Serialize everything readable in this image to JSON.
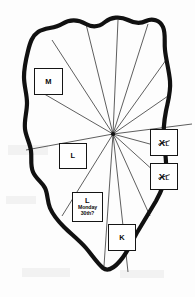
{
  "figure": {
    "type": "hand-drawn-map-diagram",
    "background_color": "#fdfdfd",
    "outline_color": "#111111",
    "sector_line_color": "#2a2a2a",
    "box_border_color": "#151515",
    "box_fill_color": "#ffffff",
    "text_color": "#0b0b0b"
  },
  "hub": {
    "label": "central-convergence-point",
    "x": 113,
    "y": 134,
    "radiating_line_count": 13
  },
  "boxes": [
    {
      "id": "box-m",
      "name": "M",
      "main": "M",
      "sub": "",
      "style": "plain",
      "x": 34,
      "y": 68,
      "width": 29,
      "height": 27
    },
    {
      "id": "box-l-left",
      "name": "L",
      "main": "L",
      "sub": "",
      "style": "plain",
      "x": 59,
      "y": 143,
      "width": 28,
      "height": 26
    },
    {
      "id": "box-xl-upper",
      "name": "XL",
      "main": "XL",
      "sub": "",
      "style": "crossed",
      "x": 150,
      "y": 129,
      "width": 28,
      "height": 27
    },
    {
      "id": "box-xl-lower",
      "name": "XL",
      "main": "XL",
      "sub": "",
      "style": "crossed",
      "x": 150,
      "y": 163,
      "width": 28,
      "height": 27
    },
    {
      "id": "box-l-monday",
      "name": "L Monday 30th?",
      "main": "L",
      "sub": "Monday\n30th?",
      "sub_line1": "Monday",
      "sub_line2": "30th?",
      "style": "multiline",
      "x": 72,
      "y": 192,
      "width": 31,
      "height": 30
    },
    {
      "id": "box-k",
      "name": "K",
      "main": "K",
      "sub": "",
      "style": "plain",
      "x": 108,
      "y": 224,
      "width": 28,
      "height": 27
    }
  ],
  "outline": {
    "stroke_width": 4.2,
    "path": "M 62,24 C 70,19 79,20 86,24 C 93,28 99,27 105,22 C 111,17 120,16 128,20 C 134,23 140,24 146,21 C 152,18 160,20 163,27 C 166,34 164,42 165,50 C 166,60 169,70 170,81 C 171,92 168,101 166,111 C 164,121 163,131 164,142 C 165,153 167,163 166,173 C 165,183 161,192 156,201 C 150,211 144,221 138,231 C 132,241 128,252 120,261 C 114,268 108,272 103,268 C 97,263 92,255 86,248 C 79,240 71,234 64,227 C 58,221 53,215 50,208 C 47,201 48,194 45,188 C 42,182 36,179 33,172 C 30,165 32,158 31,151 C 30,143 26,137 25,129 C 24,120 27,112 27,103 C 27,94 24,86 24,77 C 24,68 26,59 28,51 C 30,43 32,36 38,32 C 45,27 54,29 62,24 Z"
  },
  "sector_lines": [
    {
      "id": "line-1",
      "to_x": 52,
      "to_y": 40
    },
    {
      "id": "line-2",
      "to_x": 86,
      "to_y": 24
    },
    {
      "id": "line-3",
      "to_x": 118,
      "to_y": 20
    },
    {
      "id": "line-4",
      "to_x": 148,
      "to_y": 24
    },
    {
      "id": "line-5",
      "to_x": 166,
      "to_y": 60
    },
    {
      "id": "line-6",
      "to_x": 168,
      "to_y": 96
    },
    {
      "id": "line-7",
      "to_x": 192,
      "to_y": 124
    },
    {
      "id": "line-8",
      "to_x": 172,
      "to_y": 150
    },
    {
      "id": "line-9",
      "to_x": 166,
      "to_y": 182
    },
    {
      "id": "line-10",
      "to_x": 150,
      "to_y": 216
    },
    {
      "id": "line-11",
      "to_x": 128,
      "to_y": 272
    },
    {
      "id": "line-12",
      "to_x": 104,
      "to_y": 266
    },
    {
      "id": "line-13",
      "to_x": 62,
      "to_y": 216
    },
    {
      "id": "line-14",
      "to_x": 26,
      "to_y": 150
    },
    {
      "id": "line-15",
      "to_x": 34,
      "to_y": 88
    }
  ]
}
